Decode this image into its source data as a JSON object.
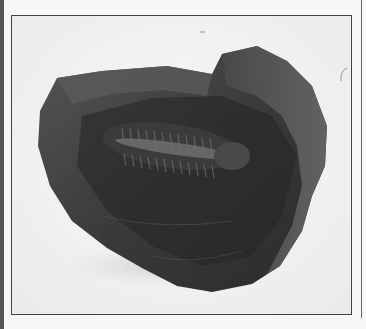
{
  "image": {
    "subject": "trilobite fossil embedded in dark rock",
    "style": "grayscale photograph",
    "colors": {
      "background": "#f4f4f4",
      "frame_border": "#444444",
      "left_bar": "#555555",
      "rock_dark": "#2e2e2e",
      "rock_mid": "#4a4a4a",
      "rock_light": "#6b6b6b"
    }
  }
}
